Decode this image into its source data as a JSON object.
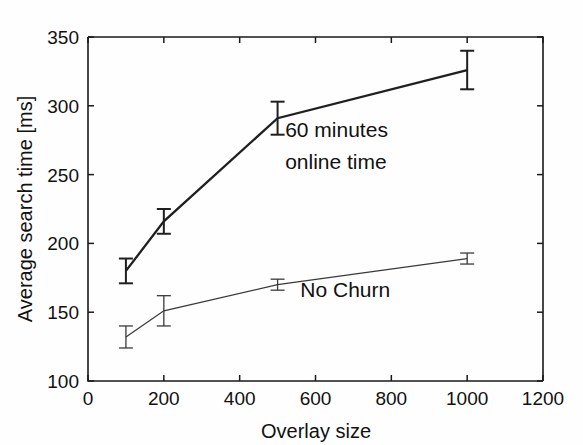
{
  "figure": {
    "background_color": "#fefefe",
    "line_color": "#1f1f1f"
  },
  "chart_data": {
    "type": "line",
    "title": "",
    "subtitle": "",
    "xlabel": "Overlay size",
    "ylabel": "Average search time [ms]",
    "xlim": [
      0,
      1200
    ],
    "ylim": [
      100,
      350
    ],
    "xticks": [
      0,
      200,
      400,
      600,
      800,
      1000,
      1200
    ],
    "xtick_labels": [
      "0",
      "200",
      "400",
      "600",
      "800",
      "1000",
      "1200"
    ],
    "yticks": [
      100,
      150,
      200,
      250,
      300,
      350
    ],
    "ytick_labels": [
      "100",
      "150",
      "200",
      "250",
      "300",
      "350"
    ],
    "grid": false,
    "legend": "inline-annotations",
    "x": [
      100,
      200,
      500,
      1000
    ],
    "series": [
      {
        "name": "60 minutes online time",
        "label_line1": "60 minutes",
        "label_line2": "online time",
        "values": [
          180,
          216,
          291,
          326
        ],
        "err_low": [
          9,
          9,
          12,
          14
        ],
        "err_high": [
          9,
          9,
          12,
          14
        ],
        "style": "thick"
      },
      {
        "name": "No Churn",
        "label_line1": "No Churn",
        "label_line2": "",
        "values": [
          132,
          151,
          170,
          189
        ],
        "err_low": [
          8,
          11,
          4,
          4
        ],
        "err_high": [
          8,
          11,
          4,
          4
        ],
        "style": "thin"
      }
    ]
  },
  "annotations": [
    {
      "text": "60 minutes",
      "x": 520,
      "y": 277
    },
    {
      "text": "online time",
      "x": 520,
      "y": 254
    },
    {
      "text": "No Churn",
      "x": 560,
      "y": 161
    }
  ]
}
